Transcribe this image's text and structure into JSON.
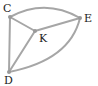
{
  "diagram": {
    "type": "graph",
    "nodes": [
      {
        "id": "C",
        "label": "C",
        "x": 10,
        "y": 17,
        "label_x": 3,
        "label_y": 12
      },
      {
        "id": "E",
        "label": "E",
        "x": 80,
        "y": 18,
        "label_x": 84,
        "label_y": 22
      },
      {
        "id": "K",
        "label": "K",
        "x": 35,
        "y": 31,
        "label_x": 39,
        "label_y": 42
      },
      {
        "id": "D",
        "label": "D",
        "x": 9,
        "y": 72,
        "label_x": 4,
        "label_y": 84
      }
    ],
    "edges": [
      {
        "from": "C",
        "to": "E",
        "curved": true
      },
      {
        "from": "C",
        "to": "K",
        "curved": false
      },
      {
        "from": "K",
        "to": "E",
        "curved": false
      },
      {
        "from": "C",
        "to": "D",
        "curved": false
      },
      {
        "from": "K",
        "to": "D",
        "curved": false
      },
      {
        "from": "E",
        "to": "D",
        "curved": true
      }
    ],
    "colors": {
      "edge": "#a6a6a6",
      "node": "#9a9a9a",
      "label": "#222222"
    }
  }
}
